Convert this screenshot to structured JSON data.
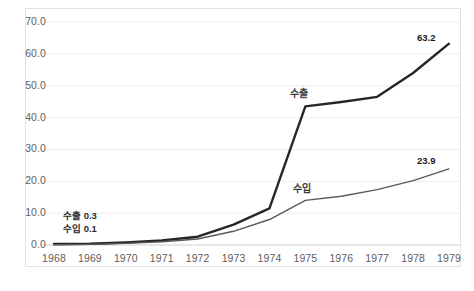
{
  "chart_data": {
    "type": "line",
    "title": "",
    "subtitle": "",
    "xlabel": "",
    "ylabel": "",
    "categories": [
      "1968",
      "1969",
      "1970",
      "1971",
      "1972",
      "1973",
      "1974",
      "1975",
      "1976",
      "1977",
      "1978",
      "1979"
    ],
    "ylim": [
      0.0,
      70.0
    ],
    "yticks": [
      "0.0",
      "10.0",
      "20.0",
      "30.0",
      "40.0",
      "50.0",
      "60.0",
      "70.0"
    ],
    "ytick_values": [
      0,
      10,
      20,
      30,
      40,
      50,
      60,
      70
    ],
    "grid": "horizontal",
    "legend": "inline-labels",
    "series": [
      {
        "name": "수출",
        "color": "#262626",
        "width": 2.4,
        "values": [
          0.3,
          0.4,
          0.8,
          1.4,
          2.6,
          6.4,
          11.5,
          43.5,
          44.9,
          46.5,
          54.0,
          63.2
        ]
      },
      {
        "name": "수입",
        "color": "#595959",
        "width": 1.4,
        "values": [
          0.1,
          0.2,
          0.5,
          1.0,
          1.9,
          4.3,
          8.0,
          14.0,
          15.3,
          17.4,
          20.2,
          23.9
        ]
      }
    ],
    "annotations": {
      "start_export": "수출 0.3",
      "start_import": "수입 0.1",
      "export_series_label": "수출",
      "import_series_label": "수입",
      "export_end_value": "63.2",
      "import_end_value": "23.9"
    }
  },
  "caption": ""
}
